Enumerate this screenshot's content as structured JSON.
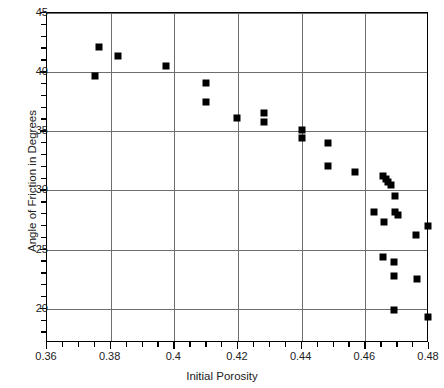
{
  "chart_data": {
    "type": "scatter",
    "title": "",
    "xlabel": "Initial Porosity",
    "ylabel": "Angle of Friction in Degrees",
    "xlim": [
      0.36,
      0.48
    ],
    "ylim": [
      17.1,
      45
    ],
    "xticks": [
      0.36,
      0.38,
      0.4,
      0.42,
      0.44,
      0.46,
      0.48
    ],
    "xtick_labels": [
      "0.36",
      "0.38",
      "0.4",
      "0.42",
      "0.44",
      "0.46",
      "0.48"
    ],
    "xminor_step": 0.005,
    "yticks": [
      20,
      25,
      30,
      35,
      40,
      45
    ],
    "ytick_labels": [
      "20",
      "25",
      "30",
      "35",
      "40",
      "45"
    ],
    "yminor_step": 1,
    "grid": true,
    "grid_color": "#6e6e6e",
    "legend": null,
    "marker": "square",
    "marker_color": "#000000",
    "marker_size": 7,
    "series": [
      {
        "name": "Angle of friction vs initial porosity",
        "points": [
          [
            0.3752,
            39.65
          ],
          [
            0.3764,
            42.15
          ],
          [
            0.3824,
            41.4
          ],
          [
            0.3974,
            40.5
          ],
          [
            0.4098,
            39.1
          ],
          [
            0.4098,
            37.5
          ],
          [
            0.4198,
            36.15
          ],
          [
            0.4282,
            36.55
          ],
          [
            0.4282,
            35.8
          ],
          [
            0.44,
            35.15
          ],
          [
            0.44,
            34.45
          ],
          [
            0.4482,
            34.0
          ],
          [
            0.4482,
            32.1
          ],
          [
            0.4566,
            31.55
          ],
          [
            0.4655,
            31.25
          ],
          [
            0.4664,
            31.0
          ],
          [
            0.4672,
            30.75
          ],
          [
            0.468,
            30.5
          ],
          [
            0.4692,
            29.55
          ],
          [
            0.4628,
            28.2
          ],
          [
            0.4692,
            28.15
          ],
          [
            0.4703,
            27.9
          ],
          [
            0.4658,
            27.3
          ],
          [
            0.476,
            26.25
          ],
          [
            0.4797,
            27.0
          ],
          [
            0.4655,
            24.4
          ],
          [
            0.469,
            23.95
          ],
          [
            0.469,
            22.8
          ],
          [
            0.4762,
            22.55
          ],
          [
            0.469,
            19.85
          ],
          [
            0.4797,
            19.3
          ]
        ]
      }
    ]
  },
  "axes": {
    "frame_color": "#000000"
  }
}
